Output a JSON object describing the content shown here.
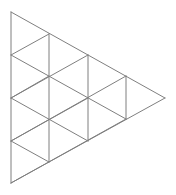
{
  "figure": {
    "background_color": "#ffffff",
    "stroke_color": "#7f7f7f",
    "stroke_color_light": "#9a9a9a",
    "stroke_width": 1,
    "canvas": {
      "width": 176,
      "height": 195
    },
    "orientation": "points-right",
    "subdivision_rows": 4,
    "vertices": {
      "outer_top": {
        "x": 11,
        "y": 12
      },
      "outer_bottom": {
        "x": 11,
        "y": 183
      },
      "outer_right_apex": {
        "x": 165,
        "y": 98
      },
      "left_edge_nodes": [
        {
          "x": 11,
          "y": 12
        },
        {
          "x": 11,
          "y": 55
        },
        {
          "x": 11,
          "y": 98
        },
        {
          "x": 11,
          "y": 141
        },
        {
          "x": 11,
          "y": 183
        }
      ],
      "interior_column_1": [
        {
          "x": 49,
          "y": 34
        },
        {
          "x": 49,
          "y": 76
        },
        {
          "x": 49,
          "y": 119
        },
        {
          "x": 49,
          "y": 162
        }
      ],
      "interior_column_2": [
        {
          "x": 88,
          "y": 55
        },
        {
          "x": 88,
          "y": 98
        },
        {
          "x": 88,
          "y": 141
        }
      ],
      "interior_column_3": [
        {
          "x": 126,
          "y": 76
        },
        {
          "x": 126,
          "y": 119
        }
      ]
    },
    "edges": {
      "outer_boundary": [
        {
          "name": "left-vertical-edge",
          "x1": 11,
          "y1": 12,
          "x2": 11,
          "y2": 183
        },
        {
          "name": "upper-right-edge",
          "x1": 11,
          "y1": 12,
          "x2": 165,
          "y2": 98
        },
        {
          "name": "lower-right-edge",
          "x1": 11,
          "y1": 183,
          "x2": 165,
          "y2": 98
        }
      ],
      "vertical_lines": [
        {
          "name": "vertical-column-1",
          "x1": 49,
          "y1": 34,
          "x2": 49,
          "y2": 162
        },
        {
          "name": "vertical-column-2",
          "x1": 88,
          "y1": 55,
          "x2": 88,
          "y2": 141
        },
        {
          "name": "vertical-column-3",
          "x1": 126,
          "y1": 76,
          "x2": 126,
          "y2": 119
        }
      ],
      "down_right_diagonals": [
        {
          "name": "diag-dr-1",
          "x1": 11,
          "y1": 55,
          "x2": 126,
          "y2": 119
        },
        {
          "name": "diag-dr-2",
          "x1": 11,
          "y1": 98,
          "x2": 88,
          "y2": 141
        },
        {
          "name": "diag-dr-3",
          "x1": 11,
          "y1": 141,
          "x2": 49,
          "y2": 162
        }
      ],
      "up_right_diagonals": [
        {
          "name": "diag-ur-1",
          "x1": 11,
          "y1": 183,
          "x2": 126,
          "y2": 119
        },
        {
          "name": "diag-ur-2",
          "x1": 11,
          "y1": 141,
          "x2": 88,
          "y2": 98
        },
        {
          "name": "diag-ur-3",
          "x1": 11,
          "y1": 98,
          "x2": 49,
          "y2": 76
        }
      ],
      "row_chords": [
        {
          "name": "row-chord-1",
          "x1": 11,
          "y1": 55,
          "x2": 49,
          "y2": 34
        },
        {
          "name": "row-chord-2",
          "x1": 11,
          "y1": 98,
          "x2": 88,
          "y2": 55
        },
        {
          "name": "row-chord-3",
          "x1": 11,
          "y1": 141,
          "x2": 126,
          "y2": 76
        }
      ]
    },
    "cell_counts": {
      "row_1_cells": 1,
      "row_2_cells": 3,
      "row_3_cells": 5,
      "row_4_cells": 7,
      "total_unit_triangles": 16
    }
  }
}
